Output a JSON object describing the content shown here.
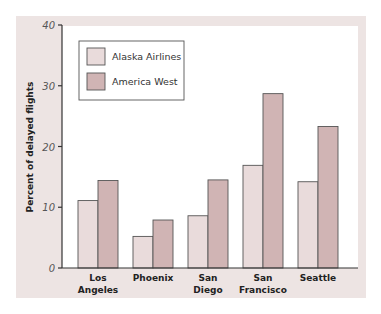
{
  "chart_data": {
    "type": "bar",
    "title": "",
    "xlabel": "",
    "ylabel": "Percent of delayed flights",
    "ylim": [
      0,
      40
    ],
    "yticks": [
      0,
      10,
      20,
      30,
      40
    ],
    "categories": [
      "Los Angeles",
      "Phoenix",
      "San Diego",
      "San Francisco",
      "Seattle"
    ],
    "category_lines": [
      [
        "Los",
        "Angeles"
      ],
      [
        "Phoenix"
      ],
      [
        "San",
        "Diego"
      ],
      [
        "San",
        "Francisco"
      ],
      [
        "Seattle"
      ]
    ],
    "series": [
      {
        "name": "Alaska Airlines",
        "color": "#e9dbdb",
        "values": [
          11.1,
          5.2,
          8.6,
          16.9,
          14.2
        ]
      },
      {
        "name": "America West",
        "color": "#d0b4b4",
        "values": [
          14.4,
          7.9,
          14.5,
          28.7,
          23.3
        ]
      }
    ],
    "legend_position": "upper-left",
    "grid": false
  },
  "colors": {
    "background": "#ede4e3",
    "plot": "#ffffff",
    "axis": "#333333"
  }
}
